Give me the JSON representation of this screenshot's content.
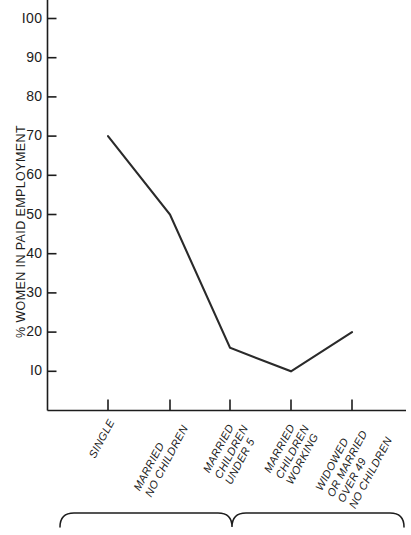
{
  "chart_data": {
    "type": "line",
    "title": "",
    "xlabel": "",
    "ylabel": "% WOMEN IN PAID EMPLOYMENT",
    "ylim": [
      0,
      105
    ],
    "yticks": [
      10,
      20,
      30,
      40,
      50,
      60,
      70,
      80,
      90,
      100
    ],
    "ytick_labels": [
      "I0",
      "20",
      "30",
      "40",
      "50",
      "60",
      "70",
      "80",
      "90",
      "I00"
    ],
    "grid": false,
    "legend_position": "none",
    "categories": [
      "SINGLE",
      "MARRIED NO CHILDREN",
      "MARRIED CHILDREN UNDER 5",
      "MARRIED CHILDREN WORKING",
      "WIDOWED OR MARRIED OVER 49 NO CHILDREN"
    ],
    "category_lines": [
      [
        "SINGLE"
      ],
      [
        "MARRIED",
        "NO CHILDREN"
      ],
      [
        "MARRIED",
        "CHILDREN",
        "UNDER 5"
      ],
      [
        "MARRIED",
        "CHILDREN",
        "WORKING"
      ],
      [
        "WIDOWED",
        "OR MARRIED",
        "OVER 49",
        "NO CHILDREN"
      ]
    ],
    "values": [
      70,
      50,
      16,
      10,
      20
    ],
    "series": [
      {
        "name": "% women in paid employment",
        "values": [
          70,
          50,
          16,
          10,
          20
        ]
      }
    ],
    "line_color": "#2a2a2a",
    "axis_color": "#1c1c1c"
  },
  "annotation": {
    "brace_caption": ""
  }
}
